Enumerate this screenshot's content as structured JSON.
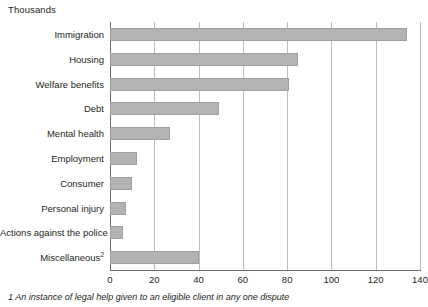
{
  "unit_label": "Thousands",
  "footnote": "1 An instance of legal help given to an eligible client in any one dispute",
  "colors": {
    "bar_fill": "#b3b3b3",
    "bar_stroke": "#a0a0a0",
    "gridline": "#bcbcbc",
    "axis": "#6d6e71",
    "text": "#231f20"
  },
  "chart_data": {
    "type": "bar",
    "orientation": "horizontal",
    "title": "",
    "subtitle": "",
    "xlabel": "Thousands",
    "ylabel": "",
    "xlim": [
      0,
      140
    ],
    "xticks": [
      0,
      20,
      40,
      60,
      80,
      100,
      120,
      140
    ],
    "xtick_labels": [
      "0",
      "20",
      "40",
      "60",
      "80",
      "100",
      "120",
      "140"
    ],
    "grid": true,
    "legend": false,
    "categories": [
      "Immigration",
      "Housing",
      "Welfare benefits",
      "Debt",
      "Mental health",
      "Employment",
      "Consumer",
      "Personal injury",
      "Actions against the police",
      "Miscellaneous"
    ],
    "category_superscripts": [
      "",
      "",
      "",
      "",
      "",
      "",
      "",
      "",
      "",
      "2"
    ],
    "values": [
      134,
      85,
      81,
      49,
      27,
      12,
      10,
      7,
      6,
      40
    ],
    "series": [
      {
        "name": "Legal help acts of assistance",
        "values": [
          134,
          85,
          81,
          49,
          27,
          12,
          10,
          7,
          6,
          40
        ]
      }
    ],
    "annotations": []
  }
}
